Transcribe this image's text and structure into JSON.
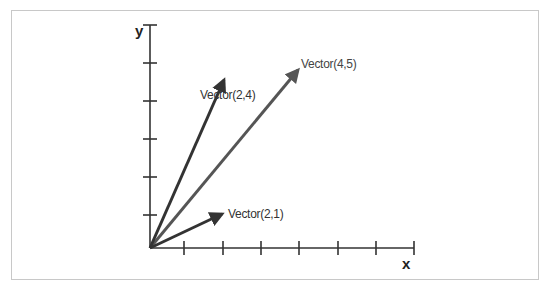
{
  "diagram": {
    "axes": {
      "x_label": "x",
      "y_label": "y",
      "x_ticks": 7,
      "y_ticks": 6
    },
    "vectors": [
      {
        "label": "Vector(2,4)",
        "x": 2,
        "y": 4,
        "color": "#333333"
      },
      {
        "label": "Vector(4,5)",
        "x": 4,
        "y": 5,
        "color": "#555555"
      },
      {
        "label": "Vector(2,1)",
        "x": 2,
        "y": 1,
        "color": "#333333"
      }
    ]
  }
}
